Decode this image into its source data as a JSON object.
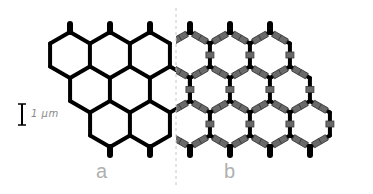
{
  "figure": {
    "panels": [
      {
        "label": "a",
        "description": "plain honeycomb lattice"
      },
      {
        "label": "b",
        "description": "decorated honeycomb lattice with nodes on bonds"
      }
    ],
    "scale_bar": {
      "label": "1 μm"
    },
    "colors": {
      "lattice": "#000000",
      "node": "#6a6a6a",
      "node_dark": "#3a3a3a",
      "divider": "#c8c8c8",
      "labels": "#b0b0b0",
      "background": "#ffffff"
    }
  }
}
